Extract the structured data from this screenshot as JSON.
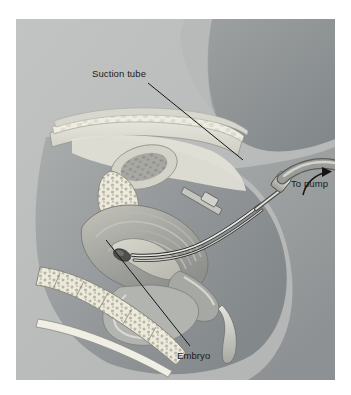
{
  "figure": {
    "kind": "medical-illustration",
    "style": "grayscale-airbrush",
    "panel": {
      "background_color": "#b9bbbb",
      "page_margin_color": "#ffffff",
      "x": 16,
      "y": 19,
      "width": 319,
      "height": 361
    },
    "text_color": "#1a1a1a",
    "leader_line_color": "#161616"
  },
  "labels": [
    {
      "id": "suction-tube",
      "text": "Suction tube",
      "x": 92,
      "y": 68,
      "leader": {
        "from_x": 148,
        "from_y": 83,
        "to_x": 243,
        "to_y": 160
      }
    },
    {
      "id": "to-pump",
      "text": "To pump",
      "x": 291,
      "y": 178,
      "leader": {
        "type": "curved-arrow",
        "from_x": 292,
        "from_y": 174,
        "to_x": 319,
        "to_y": 157
      }
    },
    {
      "id": "embryo",
      "text": "Embryo",
      "x": 177,
      "y": 350,
      "leader": {
        "from_x": 190,
        "from_y": 346,
        "to_x": 106,
        "to_y": 240
      }
    }
  ],
  "anatomy": [
    {
      "name": "abdominal-wall",
      "tone": "#d9d8d2"
    },
    {
      "name": "upper-body-wedge",
      "tone": "#8e9294"
    },
    {
      "name": "subcutaneous-fat",
      "tone": "#ececdf"
    },
    {
      "name": "uterus",
      "tone": "#9a9c9c"
    },
    {
      "name": "uterine-cavity",
      "tone": "#c9c8c0"
    },
    {
      "name": "embryo",
      "tone": "#4c4c4c"
    },
    {
      "name": "bladder",
      "tone": "#b0b2b0"
    },
    {
      "name": "pubic-bone",
      "tone": "#e6e4d8"
    },
    {
      "name": "sacrum-vertebrae",
      "tone": "#e4e2d6"
    },
    {
      "name": "rectum",
      "tone": "#aeb0ad"
    },
    {
      "name": "vagina",
      "tone": "#a8aaa8"
    },
    {
      "name": "thigh",
      "tone": "#9fa3a4"
    }
  ],
  "instruments": [
    {
      "name": "cannula",
      "tone": "#d6d6d2",
      "description": "Rigid straight cannula entering the cervix"
    },
    {
      "name": "flexible-suction-tube",
      "tone": "#8f8f8c",
      "description": "Curved tube leading off to the right toward the pump"
    },
    {
      "name": "speculum",
      "tone": "#c9c9c4",
      "description": "Blade retracting the vaginal wall"
    },
    {
      "name": "tenaculum",
      "tone": "#bdbdb8",
      "description": "Grasping instrument on the cervix"
    }
  ]
}
